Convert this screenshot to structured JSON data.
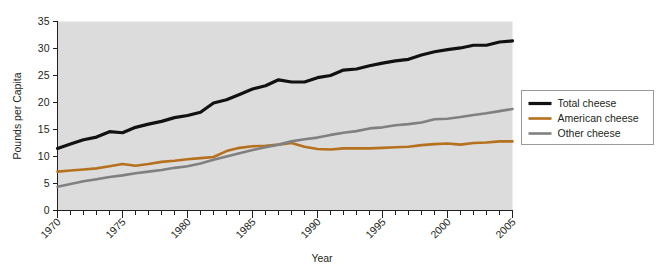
{
  "chart_data": {
    "type": "line",
    "title": "",
    "xlabel": "Year",
    "ylabel": "Pounds per Capita",
    "xlim": [
      1970,
      2005
    ],
    "ylim": [
      0,
      35
    ],
    "ytick_step": 5,
    "xtick_step": 1,
    "xtick_label_step": 5,
    "grid": false,
    "legend_position": "right",
    "plot_background": "#dcdcdc",
    "ytick_labels": [
      "0",
      "5",
      "10",
      "15",
      "20",
      "25",
      "30",
      "35"
    ],
    "xtick_labels": [
      "1970",
      "1975",
      "1980",
      "1985",
      "1990",
      "1995",
      "2000",
      "2005"
    ],
    "x": [
      1970,
      1971,
      1972,
      1973,
      1974,
      1975,
      1976,
      1977,
      1978,
      1979,
      1980,
      1981,
      1982,
      1983,
      1984,
      1985,
      1986,
      1987,
      1988,
      1989,
      1990,
      1991,
      1992,
      1993,
      1994,
      1995,
      1996,
      1997,
      1998,
      1999,
      2000,
      2001,
      2002,
      2003,
      2004,
      2005
    ],
    "series": [
      {
        "name": "Total cheese",
        "color": "#111111",
        "width": 3.2,
        "values": [
          11.5,
          12.3,
          13.1,
          13.6,
          14.6,
          14.4,
          15.4,
          16.0,
          16.5,
          17.2,
          17.6,
          18.2,
          19.9,
          20.5,
          21.5,
          22.5,
          23.1,
          24.2,
          23.8,
          23.8,
          24.6,
          25.0,
          26.0,
          26.2,
          26.8,
          27.3,
          27.7,
          28.0,
          28.8,
          29.4,
          29.8,
          30.1,
          30.6,
          30.6,
          31.2,
          31.4
        ]
      },
      {
        "name": "American cheese",
        "color": "#b5711e",
        "width": 2.6,
        "values": [
          7.2,
          7.4,
          7.6,
          7.8,
          8.2,
          8.6,
          8.3,
          8.6,
          9.0,
          9.2,
          9.5,
          9.7,
          9.9,
          11.0,
          11.6,
          11.9,
          12.0,
          12.2,
          12.5,
          11.8,
          11.4,
          11.3,
          11.5,
          11.5,
          11.5,
          11.6,
          11.7,
          11.8,
          12.1,
          12.3,
          12.4,
          12.2,
          12.5,
          12.6,
          12.8,
          12.8
        ]
      },
      {
        "name": "Other cheese",
        "color": "#808080",
        "width": 2.6,
        "values": [
          4.4,
          4.9,
          5.4,
          5.8,
          6.2,
          6.5,
          6.9,
          7.2,
          7.5,
          7.9,
          8.2,
          8.7,
          9.4,
          10.0,
          10.6,
          11.2,
          11.7,
          12.2,
          12.8,
          13.2,
          13.5,
          14.0,
          14.4,
          14.7,
          15.2,
          15.4,
          15.8,
          16.0,
          16.3,
          16.9,
          17.0,
          17.3,
          17.7,
          18.0,
          18.4,
          18.8
        ]
      }
    ]
  },
  "legend": {
    "entries": [
      {
        "label": "Total cheese",
        "color": "#111111",
        "width": 3.2
      },
      {
        "label": "American cheese",
        "color": "#b5711e",
        "width": 2.6
      },
      {
        "label": "Other cheese",
        "color": "#808080",
        "width": 2.6
      }
    ]
  }
}
